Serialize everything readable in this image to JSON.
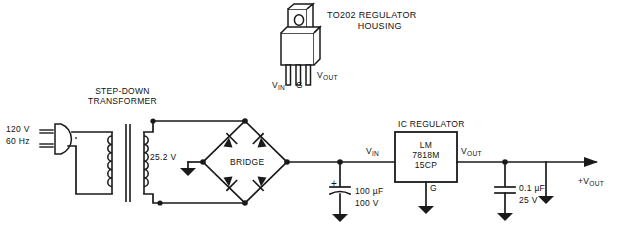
{
  "diagram": {
    "background_color": "#ffffff",
    "line_color": "#1a1a1a"
  },
  "labels": {
    "to202_line1": "TO202 REGULATOR",
    "to202_line2": "HOUSING",
    "transformer_line1": "STEP-DOWN",
    "transformer_line2": "TRANSFORMER",
    "mains_line1": "120 V",
    "mains_line2": "60 Hz",
    "secondary_voltage": "25.2 V",
    "bridge": "BRIDGE",
    "ic_regulator": "IC REGULATOR",
    "ic_part_line1": "LM",
    "ic_part_line2": "7818M",
    "ic_part_line3": "15CP",
    "ic_ground_pin": "G",
    "pkg_pin_vin": "V",
    "pkg_pin_vin_sub": "IN",
    "pkg_pin_g": "G",
    "pkg_pin_vout": "V",
    "pkg_pin_vout_sub": "OUT",
    "node_vin": "V",
    "node_vin_sub": "IN",
    "node_vout": "V",
    "node_vout_sub": "OUT",
    "cap1_value": "100 µF",
    "cap1_voltage": "100 V",
    "cap1_polarity": "+",
    "cap2_value": "0.1 µF",
    "cap2_voltage": "25 V",
    "output_terminal": "+V",
    "output_terminal_sub": "OUT"
  },
  "components": [
    {
      "name": "ac-plug",
      "type": "connector",
      "label": "120 V 60 Hz"
    },
    {
      "name": "step-down-transformer",
      "type": "transformer",
      "primary": "120 V",
      "secondary": "25.2 V"
    },
    {
      "name": "bridge-rectifier",
      "type": "bridge",
      "label": "BRIDGE",
      "diode_count": 4
    },
    {
      "name": "filter-capacitor",
      "type": "capacitor-polarized",
      "value": "100 µF",
      "rating": "100 V"
    },
    {
      "name": "ic-regulator",
      "type": "ic",
      "part": "LM 7818M 15CP"
    },
    {
      "name": "output-capacitor",
      "type": "capacitor",
      "value": "0.1 µF",
      "rating": "25 V"
    },
    {
      "name": "to202-package",
      "type": "package-illustration",
      "pins": [
        "V IN",
        "G",
        "V OUT"
      ]
    }
  ]
}
